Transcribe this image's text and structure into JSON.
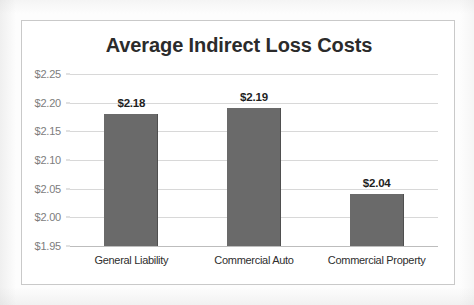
{
  "chart_data": {
    "type": "bar",
    "title": "Average Indirect Loss Costs",
    "xlabel": "",
    "ylabel": "",
    "categories": [
      "General Liability",
      "Commercial Auto",
      "Commercial Property"
    ],
    "values": [
      2.18,
      2.19,
      2.04
    ],
    "data_labels": [
      "$2.18",
      "$2.19",
      "$2.04"
    ],
    "ylim": [
      1.95,
      2.25
    ],
    "ytick_values": [
      2.25,
      2.2,
      2.15,
      2.1,
      2.05,
      2.0,
      1.95
    ],
    "ytick_labels": [
      "$2.25",
      "$2.20",
      "$2.15",
      "$2.10",
      "$2.05",
      "$2.00",
      "$1.95"
    ],
    "grid": true,
    "legend": false,
    "legend_position": "none",
    "series": [
      {
        "name": "Average Indirect Loss Costs",
        "values": [
          2.18,
          2.19,
          2.04
        ],
        "color": "#6a6a6a"
      }
    ]
  },
  "colors": {
    "bar_fill": "#6a6a6a",
    "bar_edge": "#4f4f4f",
    "gridline": "#d8d8d8",
    "axis_line": "#bdbdbd",
    "title_text": "#2b2b2b",
    "tick_text": "#7d7d7d",
    "label_text": "#1f1f1f",
    "frame_border": "#c9c9c9",
    "background": "#ffffff"
  }
}
